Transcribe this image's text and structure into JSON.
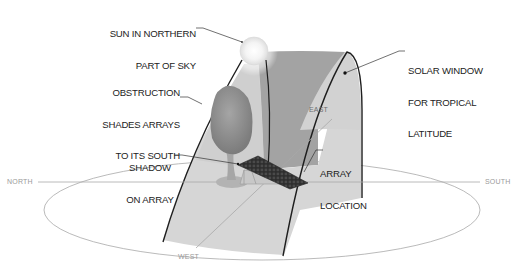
{
  "diagram": {
    "type": "solar-window-illustration",
    "callouts": {
      "sun": {
        "line1": "SUN IN NORTHERN",
        "line2": "PART OF SKY"
      },
      "obstruction": {
        "line1": "OBSTRUCTION",
        "line2": "SHADES ARRAYS",
        "line3": "TO ITS SOUTH"
      },
      "solar_window": {
        "line1": "SOLAR WINDOW",
        "line2": "FOR TROPICAL",
        "line3": "LATITUDE"
      },
      "shadow": {
        "line1": "SHADOW",
        "line2": "ON ARRAY"
      },
      "array_location": {
        "line1": "ARRAY",
        "line2": "LOCATION"
      }
    },
    "directions": {
      "north": "NORTH",
      "south": "SOUTH",
      "east": "EAST",
      "west": "WEST"
    },
    "colors": {
      "window_light": "#d4d4d4",
      "window_dark": "#9e9e9e",
      "tree_canopy": "#8a8a8a",
      "array_panel": "#2e2e2e",
      "ellipse_stroke": "#9a9a9a",
      "arc_stroke": "#1e1e1e",
      "sun_fill": "#f7f7f7"
    }
  }
}
